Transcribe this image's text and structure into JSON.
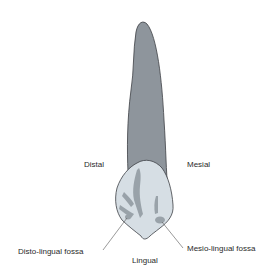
{
  "figure": {
    "colors": {
      "root": "#8e959c",
      "root_outline": "#3c3f44",
      "crown": "#d6dee4",
      "crown_outline": "#3c3f44",
      "fossa_shade": "#8f989f",
      "leader_line": "#555555",
      "text": "#2a2a2a"
    }
  },
  "labels": {
    "distal": "Distal",
    "mesial": "Mesial",
    "lingual": "Lingual",
    "disto_lingual_fossa": "Disto-lingual fossa",
    "mesio_lingual_fossa": "Mesio-lingual fossa"
  }
}
